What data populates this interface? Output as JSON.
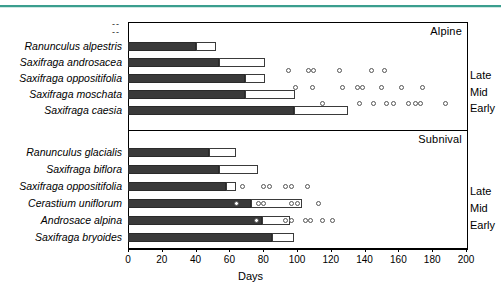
{
  "chart_data": {
    "type": "bar",
    "title": "",
    "xlabel": "Days",
    "ylabel": "",
    "xlim": [
      0,
      200
    ],
    "xticks": [
      0,
      20,
      40,
      60,
      80,
      100,
      120,
      140,
      160,
      180,
      200
    ],
    "grid": false,
    "legend_position": "right-margin",
    "orientation": "horizontal",
    "panels": [
      {
        "name": "Alpine",
        "label": "Alpine",
        "categories": [
          "Ranunculus alpestris",
          "Saxifraga androsacea",
          "Saxifraga oppositifolia",
          "Saxifraga moschata",
          "Saxifraga caesia"
        ],
        "series": [
          {
            "name": "dark-segment",
            "color": "#3a3a3a",
            "values": [
              40,
              54,
              69,
              69,
              98
            ]
          },
          {
            "name": "light-segment",
            "color": "#ffffff",
            "values": [
              52,
              81,
              81,
              99,
              130
            ]
          }
        ],
        "scatter_rows": [
          {
            "label": "Late",
            "values": [
              95,
              107,
              110,
              125,
              144,
              152
            ]
          },
          {
            "label": "Mid",
            "values": [
              99,
              109,
              127,
              136,
              139,
              150,
              162,
              174
            ]
          },
          {
            "label": "Early",
            "values": [
              115,
              137,
              145,
              153,
              157,
              166,
              170,
              173,
              188
            ]
          }
        ]
      },
      {
        "name": "Subnival",
        "label": "Subnival",
        "categories": [
          "Ranunculus glacialis",
          "Saxifraga biflora",
          "Saxifraga oppositifolia",
          "Cerastium uniflorum",
          "Androsace alpina",
          "Saxifraga bryoides"
        ],
        "series": [
          {
            "name": "dark-segment",
            "color": "#3a3a3a",
            "values": [
              48,
              54,
              58,
              73,
              79,
              85
            ]
          },
          {
            "name": "light-segment",
            "color": "#ffffff",
            "values": [
              64,
              77,
              64,
              103,
              96,
              98
            ]
          }
        ],
        "scatter_rows": [
          {
            "label": "Late",
            "values": [
              68,
              80,
              84,
              93,
              97,
              106
            ]
          },
          {
            "label": "Mid",
            "values": [
              64,
              77,
              80,
              97,
              100,
              113
            ]
          },
          {
            "label": "Early",
            "values": [
              76,
              93,
              97,
              105,
              108,
              115,
              121
            ]
          }
        ]
      }
    ]
  },
  "axis": {
    "title": "Days",
    "tick_labels": [
      "0",
      "20",
      "40",
      "60",
      "80",
      "100",
      "120",
      "140",
      "160",
      "180",
      "200"
    ]
  },
  "side_labels": {
    "alpine": [
      "Late",
      "Mid",
      "Early"
    ],
    "subnival": [
      "Late",
      "Mid",
      "Early"
    ]
  },
  "panel_titles": {
    "alpine": "Alpine",
    "subnival": "Subnival"
  },
  "marks": {
    "dashes": "--"
  },
  "colors": {
    "dark_segment": "#3a3a3a",
    "light_segment": "#ffffff",
    "frame": "#000000",
    "marker_stroke": "#555555",
    "top_rule": "#3a9e8e"
  }
}
